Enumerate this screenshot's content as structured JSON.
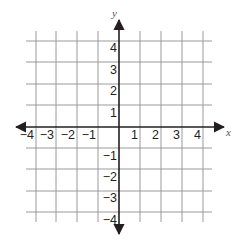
{
  "diagram": {
    "type": "coordinate-plane",
    "x_axis": {
      "label": "x",
      "min": -4,
      "max": 4,
      "tick_labels": [
        "−4",
        "−3",
        "−2",
        "−1",
        "1",
        "2",
        "3",
        "4"
      ],
      "tick_values": [
        -4,
        -3,
        -2,
        -1,
        1,
        2,
        3,
        4
      ]
    },
    "y_axis": {
      "label": "y",
      "min": -4,
      "max": 4,
      "tick_labels": [
        "4",
        "3",
        "2",
        "1",
        "−1",
        "−2",
        "−3",
        "−4"
      ],
      "tick_values": [
        4,
        3,
        2,
        1,
        -1,
        -2,
        -3,
        -4
      ]
    },
    "grid": {
      "visible": true,
      "step": 1,
      "extends_beyond_labels": true
    },
    "colors": {
      "grid": "#9a9a9a",
      "axis": "#231f20",
      "text": "#231f20",
      "background": "#ffffff"
    }
  }
}
